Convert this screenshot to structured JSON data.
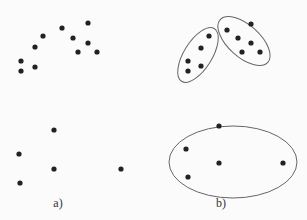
{
  "panels": [
    {
      "label": "a)",
      "label_pos": [
        58,
        205
      ],
      "points": [
        [
          21,
          61
        ],
        [
          21,
          71
        ],
        [
          35,
          47
        ],
        [
          35,
          67
        ],
        [
          43,
          36
        ],
        [
          62,
          28
        ],
        [
          73,
          38
        ],
        [
          88,
          23
        ],
        [
          88,
          43
        ],
        [
          78,
          52
        ],
        [
          97,
          52
        ],
        [
          54,
          130
        ],
        [
          19,
          154
        ],
        [
          54,
          169
        ],
        [
          121,
          169
        ],
        [
          20,
          183
        ]
      ],
      "ellipses": []
    },
    {
      "label": "b)",
      "label_pos": [
        221,
        205
      ],
      "points": [
        [
          209,
          36
        ],
        [
          201,
          48
        ],
        [
          188,
          61
        ],
        [
          188,
          71
        ],
        [
          201,
          66
        ],
        [
          227,
          30
        ],
        [
          251,
          24
        ],
        [
          238,
          38
        ],
        [
          251,
          43
        ],
        [
          242,
          52
        ],
        [
          260,
          52
        ],
        [
          219,
          126
        ],
        [
          186,
          149
        ],
        [
          219,
          163
        ],
        [
          283,
          163
        ],
        [
          188,
          177
        ]
      ],
      "ellipses": [
        {
          "cx": 198,
          "cy": 55,
          "rx": 14,
          "ry": 31,
          "rotate": 32
        },
        {
          "cx": 244,
          "cy": 41,
          "rx": 16,
          "ry": 32,
          "rotate": -48
        },
        {
          "cx": 233,
          "cy": 162,
          "rx": 64,
          "ry": 36,
          "rotate": 0
        }
      ]
    }
  ],
  "colors": {
    "point": "#222222",
    "ellipse": "#666666"
  }
}
